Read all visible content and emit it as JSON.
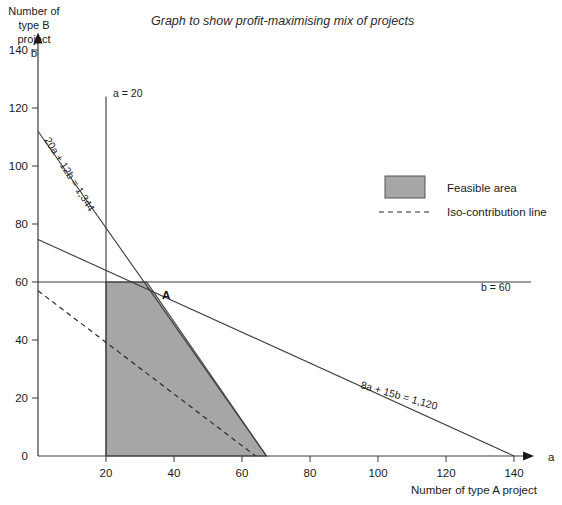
{
  "title": "Graph to show profit-maximising mix of projects",
  "axes": {
    "y_caption_lines": [
      "Number of",
      "type B",
      "project"
    ],
    "y_symbol": "b",
    "x_symbol": "a",
    "x_caption": "Number of type A project",
    "x_ticks": [
      20,
      40,
      60,
      80,
      100,
      120,
      140
    ],
    "y_ticks": [
      0,
      20,
      40,
      60,
      80,
      100,
      120,
      140
    ],
    "xlim": [
      0,
      145
    ],
    "ylim": [
      0,
      145
    ],
    "grid": false
  },
  "legend": {
    "position": "upper-right",
    "items": [
      {
        "type": "swatch",
        "label": "Feasible area",
        "color": "#a6a6a6"
      },
      {
        "type": "dashed",
        "label": "Iso-contribution line",
        "color": "#2a2a2a"
      }
    ]
  },
  "annotations": {
    "point_a": "A",
    "vertical_constraint": "a = 20",
    "horizontal_constraint": "b = 60",
    "constraint_1": "20a + 12b = 1,344",
    "constraint_2": "8a + 15b = 1,120"
  },
  "chart_data": {
    "type": "line",
    "title": "Graph to show profit-maximising mix of projects",
    "xlabel": "Number of type A project",
    "ylabel": "Number of type B project",
    "xlim": [
      0,
      145
    ],
    "ylim": [
      0,
      145
    ],
    "grid": false,
    "legend_position": "upper-right",
    "series": [
      {
        "name": "20a + 12b = 1,344",
        "style": "solid",
        "label": "20a + 12b = 1,344",
        "points": [
          [
            0,
            112
          ],
          [
            67.2,
            0
          ]
        ]
      },
      {
        "name": "8a + 15b = 1,120",
        "style": "solid",
        "label": "8a + 15b = 1,120",
        "points": [
          [
            0,
            74.67
          ],
          [
            140,
            0
          ]
        ]
      },
      {
        "name": "a = 20",
        "style": "solid",
        "label": "a = 20",
        "points": [
          [
            20,
            0
          ],
          [
            20,
            124
          ]
        ]
      },
      {
        "name": "b = 60",
        "style": "solid",
        "label": "b = 60",
        "points": [
          [
            0,
            60
          ],
          [
            145,
            60
          ]
        ]
      },
      {
        "name": "Iso-contribution line",
        "style": "dashed",
        "label": "Iso-contribution line",
        "points": [
          [
            0,
            57
          ],
          [
            64,
            0
          ]
        ]
      }
    ],
    "regions": [
      {
        "name": "Feasible area",
        "fill": "#a6a6a6",
        "vertices": [
          [
            20,
            0
          ],
          [
            20,
            60
          ],
          [
            32,
            60
          ],
          [
            67.2,
            0
          ]
        ]
      }
    ],
    "annotated_points": [
      {
        "label": "A",
        "x": 32,
        "y": 60
      }
    ]
  }
}
